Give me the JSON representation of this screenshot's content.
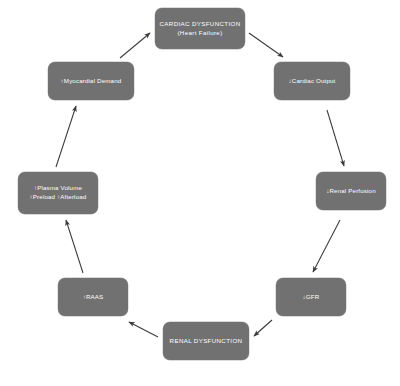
{
  "diagram": {
    "type": "cycle-flowchart",
    "direction": "clockwise",
    "canvas": {
      "width": 400,
      "height": 386
    },
    "style": {
      "box_fill": "#717171",
      "box_text_color": "#ffffff",
      "arrow_color": "#3a3a3a",
      "background": "#ffffff"
    },
    "nodes": [
      {
        "id": "cardiac-dysfunction",
        "label": "CARDIAC DYSFUNCTION\n(Heart Failure)",
        "emphasis": "uppercase-primary",
        "x": 155,
        "y": 8,
        "w": 90,
        "h": 41
      },
      {
        "id": "cardiac-output",
        "label": "↓Cardiac Output",
        "emphasis": "normal",
        "x": 274,
        "y": 62,
        "w": 76,
        "h": 38
      },
      {
        "id": "renal-perfusion",
        "label": "↓Renal Perfusion",
        "emphasis": "normal",
        "x": 316,
        "y": 172,
        "w": 70,
        "h": 38
      },
      {
        "id": "gfr",
        "label": "↓GFR",
        "emphasis": "normal",
        "x": 276,
        "y": 278,
        "w": 70,
        "h": 38
      },
      {
        "id": "renal-dysfunction",
        "label": "RENAL DYSFUNCTION",
        "emphasis": "uppercase-primary",
        "x": 163,
        "y": 322,
        "w": 86,
        "h": 38
      },
      {
        "id": "raas",
        "label": "↑RAAS",
        "emphasis": "normal",
        "x": 58,
        "y": 278,
        "w": 70,
        "h": 38
      },
      {
        "id": "plasma-volume",
        "label": "↑Plasma Volume\n↑Preload ↑Afterload",
        "emphasis": "normal",
        "x": 18,
        "y": 172,
        "w": 80,
        "h": 42
      },
      {
        "id": "myocardial-demand",
        "label": "↑Myocardial Demand",
        "emphasis": "normal",
        "x": 48,
        "y": 62,
        "w": 86,
        "h": 38
      }
    ],
    "arrows": [
      {
        "id": "arrow-myocardial-demand-to-cardiac-dysfunction",
        "from": "myocardial-demand",
        "to": "cardiac-dysfunction",
        "x1": 120,
        "y1": 58,
        "x2": 150,
        "y2": 33
      },
      {
        "id": "arrow-cardiac-dysfunction-to-cardiac-output",
        "from": "cardiac-dysfunction",
        "to": "cardiac-output",
        "x1": 249,
        "y1": 33,
        "x2": 283,
        "y2": 57
      },
      {
        "id": "arrow-cardiac-output-to-renal-perfusion",
        "from": "cardiac-output",
        "to": "renal-perfusion",
        "x1": 327,
        "y1": 110,
        "x2": 344,
        "y2": 166
      },
      {
        "id": "arrow-renal-perfusion-to-gfr",
        "from": "renal-perfusion",
        "to": "gfr",
        "x1": 340,
        "y1": 220,
        "x2": 313,
        "y2": 272
      },
      {
        "id": "arrow-gfr-to-renal-dysfunction",
        "from": "gfr",
        "to": "renal-dysfunction",
        "x1": 272,
        "y1": 320,
        "x2": 254,
        "y2": 336
      },
      {
        "id": "arrow-renal-dysfunction-to-raas",
        "from": "renal-dysfunction",
        "to": "raas",
        "x1": 158,
        "y1": 337,
        "x2": 129,
        "y2": 322
      },
      {
        "id": "arrow-raas-to-plasma-volume",
        "from": "raas",
        "to": "plasma-volume",
        "x1": 83,
        "y1": 273,
        "x2": 66,
        "y2": 220
      },
      {
        "id": "arrow-plasma-volume-to-myocardial-demand",
        "from": "plasma-volume",
        "to": "myocardial-demand",
        "x1": 56,
        "y1": 167,
        "x2": 76,
        "y2": 106
      }
    ]
  }
}
